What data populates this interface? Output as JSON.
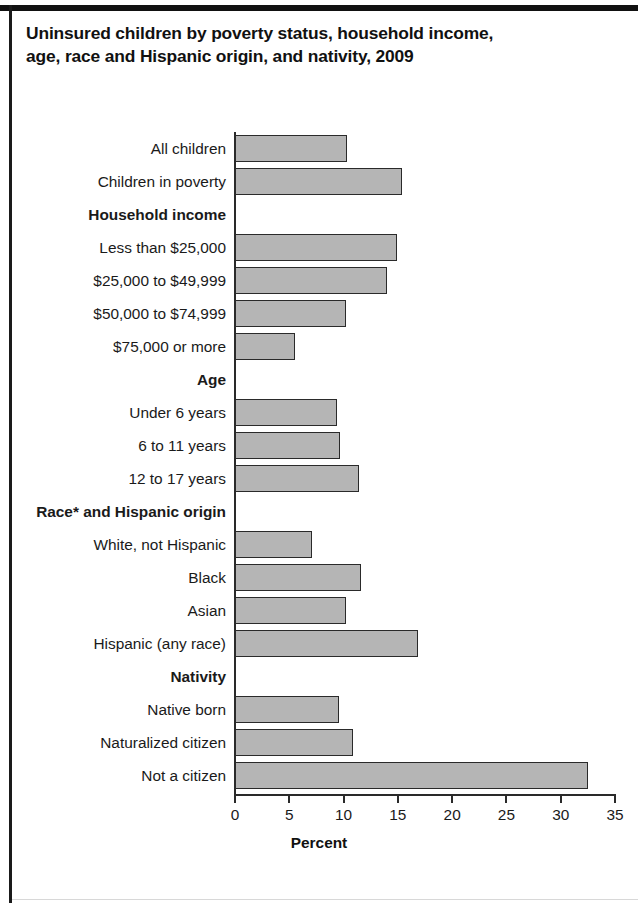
{
  "title": {
    "line1": "Uninsured children by poverty status, household income,",
    "line2": "age, race and Hispanic origin, and nativity, 2009"
  },
  "chart_data": {
    "type": "bar",
    "orientation": "horizontal",
    "title": "Uninsured children by poverty status, household income, age, race and Hispanic origin, and nativity, 2009",
    "xlabel": "Percent",
    "ylabel": "",
    "xlim": [
      0,
      35
    ],
    "xticks": [
      0,
      5,
      10,
      15,
      20,
      25,
      30,
      35
    ],
    "xticklabels": [
      "0",
      "5",
      "10",
      "15",
      "20",
      "25",
      "30",
      "35"
    ],
    "grid": false,
    "legend": null,
    "bar_fill_color": "#b5b5b5",
    "bar_edge_color": "#2a2a2a",
    "rows": [
      {
        "label": "All children",
        "value": 10.3,
        "is_header": false
      },
      {
        "label": "Children in poverty",
        "value": 15.4,
        "is_header": false
      },
      {
        "label": "Household income",
        "value": null,
        "is_header": true
      },
      {
        "label": "Less than $25,000",
        "value": 14.9,
        "is_header": false
      },
      {
        "label": "$25,000 to $49,999",
        "value": 14.0,
        "is_header": false
      },
      {
        "label": "$50,000 to $74,999",
        "value": 10.2,
        "is_header": false
      },
      {
        "label": "$75,000 or more",
        "value": 5.5,
        "is_header": false
      },
      {
        "label": "Age",
        "value": null,
        "is_header": true
      },
      {
        "label": "Under 6 years",
        "value": 9.4,
        "is_header": false
      },
      {
        "label": "6 to 11 years",
        "value": 9.7,
        "is_header": false
      },
      {
        "label": "12 to 17 years",
        "value": 11.4,
        "is_header": false
      },
      {
        "label": "Race* and Hispanic origin",
        "value": null,
        "is_header": true
      },
      {
        "label": "White, not Hispanic",
        "value": 7.1,
        "is_header": false
      },
      {
        "label": "Black",
        "value": 11.6,
        "is_header": false
      },
      {
        "label": "Asian",
        "value": 10.2,
        "is_header": false
      },
      {
        "label": "Hispanic (any race)",
        "value": 16.9,
        "is_header": false
      },
      {
        "label": "Nativity",
        "value": null,
        "is_header": true
      },
      {
        "label": "Native born",
        "value": 9.6,
        "is_header": false
      },
      {
        "label": "Naturalized citizen",
        "value": 10.9,
        "is_header": false
      },
      {
        "label": "Not a citizen",
        "value": 32.5,
        "is_header": false
      }
    ]
  }
}
